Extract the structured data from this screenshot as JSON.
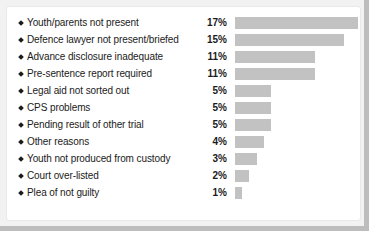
{
  "chart_data": {
    "type": "bar",
    "title": "",
    "subtitle": "",
    "xlabel": "",
    "ylabel": "",
    "orientation": "horizontal",
    "grid": false,
    "legend": null,
    "value_suffix": "%",
    "xlim": [
      0,
      17
    ],
    "categories": [
      "Youth/parents not present",
      "Defence lawyer not present/briefed",
      "Advance disclosure inadequate",
      "Pre-sentence report required",
      "Legal aid not sorted out",
      "CPS problems",
      "Pending result of other trial",
      "Other reasons",
      "Youth not produced from custody",
      "Court over-listed",
      "Plea of not guilty"
    ],
    "values": [
      17,
      15,
      11,
      11,
      5,
      5,
      5,
      4,
      3,
      2,
      1
    ],
    "value_labels": [
      "17%",
      "15%",
      "11%",
      "11%",
      "5%",
      "5%",
      "5%",
      "4%",
      "3%",
      "2%",
      "1%"
    ]
  },
  "style": {
    "bar_color": "#c2c2c2",
    "text_color": "#1b1b1b",
    "panel_background": "#ffffff",
    "frame_color": "#bdbdbd"
  },
  "rows": [
    {
      "bullet": "diamond-bullet-icon",
      "label": "Youth/parents not present",
      "pct": "17%",
      "value": 17
    },
    {
      "bullet": "diamond-bullet-icon",
      "label": "Defence lawyer not present/briefed",
      "pct": "15%",
      "value": 15
    },
    {
      "bullet": "diamond-bullet-icon",
      "label": "Advance disclosure inadequate",
      "pct": "11%",
      "value": 11
    },
    {
      "bullet": "diamond-bullet-icon",
      "label": "Pre-sentence report required",
      "pct": "11%",
      "value": 11
    },
    {
      "bullet": "diamond-bullet-icon",
      "label": "Legal aid not sorted out",
      "pct": "5%",
      "value": 5
    },
    {
      "bullet": "diamond-bullet-icon",
      "label": "CPS problems",
      "pct": "5%",
      "value": 5
    },
    {
      "bullet": "diamond-bullet-icon",
      "label": "Pending result of other trial",
      "pct": "5%",
      "value": 5
    },
    {
      "bullet": "diamond-bullet-icon",
      "label": "Other reasons",
      "pct": "4%",
      "value": 4
    },
    {
      "bullet": "diamond-bullet-icon",
      "label": "Youth not produced from custody",
      "pct": "3%",
      "value": 3
    },
    {
      "bullet": "diamond-bullet-icon",
      "label": "Court over-listed",
      "pct": "2%",
      "value": 2
    },
    {
      "bullet": "diamond-bullet-icon",
      "label": "Plea of not guilty",
      "pct": "1%",
      "value": 1
    }
  ]
}
